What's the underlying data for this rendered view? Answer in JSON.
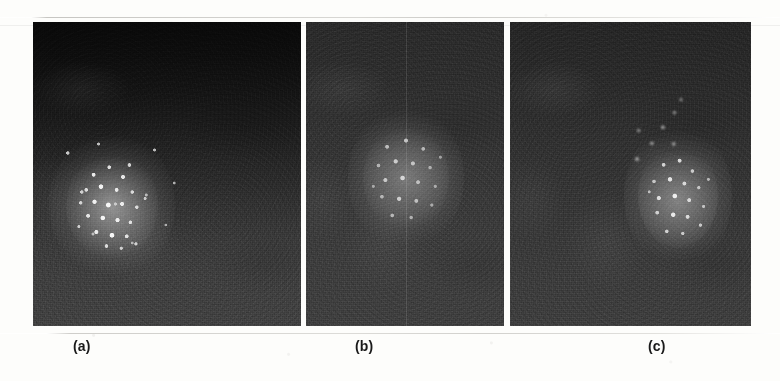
{
  "figure": {
    "kind": "multi-panel grayscale speckle images",
    "panel_count": 3,
    "background_color": "#fdfdfb",
    "rule_color": "#c9c8c4"
  },
  "panels": [
    {
      "id": "panel-a",
      "caption": "(a)",
      "x": 33,
      "y": 22,
      "width": 268,
      "height": 304,
      "base_color": "#232323",
      "description": "dark speckle field, strong top-to-bottom brightness gradient",
      "cluster": {
        "center_x": 112,
        "center_y": 205,
        "width": 92,
        "height": 108,
        "brightness": "high",
        "label": "bright-speckle-cluster"
      }
    },
    {
      "id": "panel-b",
      "caption": "(b)",
      "x": 306,
      "y": 22,
      "width": 198,
      "height": 304,
      "base_color": "#363636",
      "description": "uniform mid-gray speckle field with faint vertical seam",
      "cluster": {
        "center_x": 406,
        "center_y": 178,
        "width": 86,
        "height": 104,
        "brightness": "low",
        "label": "diffuse-speckle-cluster"
      },
      "seam_x": 406
    },
    {
      "id": "panel-c",
      "caption": "(c)",
      "x": 510,
      "y": 22,
      "width": 241,
      "height": 304,
      "base_color": "#323232",
      "description": "mid-gray speckle field, cluster offset toward right with upper-left tail",
      "cluster": {
        "center_x": 678,
        "center_y": 196,
        "width": 80,
        "height": 104,
        "brightness": "medium",
        "label": "offset-speckle-cluster"
      }
    }
  ],
  "captions": [
    {
      "text": "(a)",
      "x": 73,
      "y": 338
    },
    {
      "text": "(b)",
      "x": 355,
      "y": 338
    },
    {
      "text": "(c)",
      "x": 648,
      "y": 338
    }
  ]
}
